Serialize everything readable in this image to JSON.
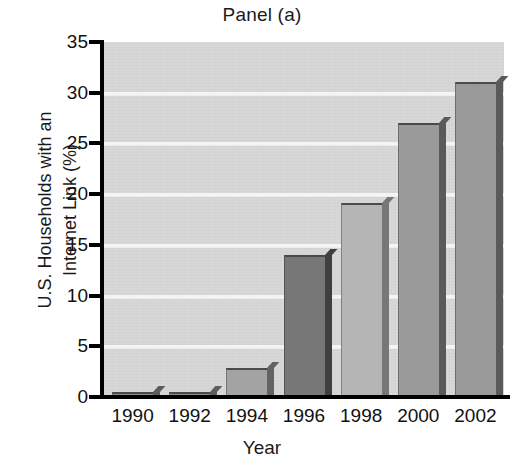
{
  "chart_data": {
    "type": "bar",
    "title": "Panel (a)",
    "xlabel": "Year",
    "ylabel": "U.S. Households with an Internet Link (%)",
    "ylabel_lines": [
      "U.S. Households with an",
      "Internet Link (%)"
    ],
    "categories": [
      "1990",
      "1992",
      "1994",
      "1996",
      "1998",
      "2000",
      "2002"
    ],
    "values": [
      0.3,
      0.3,
      2.9,
      14.0,
      19.1,
      27.0,
      31.1
    ],
    "ylim": [
      0,
      35
    ],
    "yticks": [
      0,
      5,
      10,
      15,
      20,
      25,
      30,
      35
    ],
    "ytick_labels": [
      "0",
      "5",
      "10",
      "15",
      "20",
      "25",
      "30",
      "35"
    ],
    "grid": true,
    "grid_axis": "y",
    "grid_color": "#f4f4f4",
    "plot_background": "#d6d6d6",
    "legend": null,
    "bar_colors": [
      "#8f8f8f",
      "#8f8f8f",
      "#a3a3a3",
      "#777777",
      "#b5b5b5",
      "#9a9a9a",
      "#999999"
    ],
    "bar_side_colors": [
      "#5d5d5d",
      "#5d5d5d",
      "#636363",
      "#3f3f3f",
      "#777777",
      "#5a5a5a",
      "#5a5a5a"
    ],
    "series_note": "single series"
  },
  "colors": {
    "axis": "#000000",
    "text": "#111111",
    "page_background": "#ffffff"
  }
}
